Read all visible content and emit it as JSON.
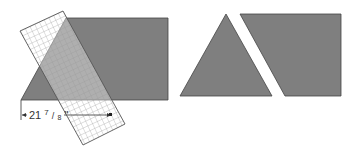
{
  "diagram": {
    "measurement_label": "21 7/8\"",
    "measurement_whole": "21",
    "measurement_num": "7",
    "measurement_den": "8",
    "measurement_unit": "\"",
    "colors": {
      "fabric": "#7f7f7f",
      "outline": "#444444",
      "ruler_grid": "#9a9a9a",
      "background": "#ffffff"
    },
    "left_figure": {
      "shape": "parallelogram-end fabric strip with overlaid ruler",
      "cut": "diagonal 60-degree cut"
    },
    "right_figure": {
      "pieces": [
        "triangle",
        "trapezoid"
      ]
    }
  }
}
